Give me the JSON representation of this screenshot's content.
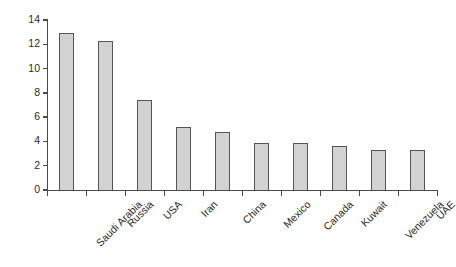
{
  "figure": {
    "background_color": "#ffffff",
    "bar_fill_color": "#d2d2d2",
    "bar_border_color": "#555555",
    "axis_color": "#4a4a4a"
  },
  "chart_data": {
    "type": "bar",
    "title": "",
    "subtitle": "",
    "xlabel": "",
    "ylabel": "% of world total",
    "ylim": [
      0,
      14
    ],
    "ytick_values": [
      0,
      2,
      4,
      6,
      8,
      10,
      12,
      14
    ],
    "ytick_labels": [
      "0",
      "2",
      "4",
      "6",
      "8",
      "10",
      "12",
      "14"
    ],
    "grid": false,
    "legend": null,
    "annotations": [],
    "categories": [
      "Saudi Arabia",
      "Russia",
      "USA",
      "Iran",
      "China",
      "Mexico",
      "Canada",
      "Kuwait",
      "Venezuela",
      "UAE"
    ],
    "values": [
      12.9,
      12.3,
      7.45,
      5.2,
      4.75,
      3.9,
      3.9,
      3.6,
      3.3,
      3.3
    ]
  }
}
